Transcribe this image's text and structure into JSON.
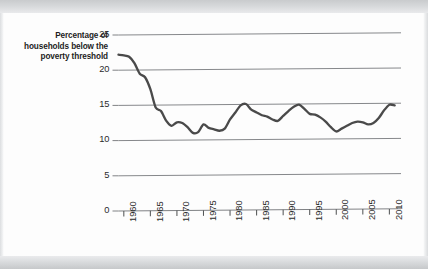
{
  "chart_data": {
    "type": "line",
    "title": "",
    "subtitle": "",
    "ylabel": "Percentage of households below the poverty threshold",
    "xlabel": "",
    "ylim": [
      0,
      25
    ],
    "xlim": [
      1959,
      2012
    ],
    "yticks": [
      0,
      5,
      10,
      15,
      20,
      25
    ],
    "xticks": [
      1960,
      1965,
      1970,
      1975,
      1980,
      1985,
      1990,
      1995,
      2000,
      2005,
      2010
    ],
    "grid": "horizontal",
    "legend": "none",
    "series": [
      {
        "name": "Percentage of households below the poverty threshold",
        "color": "#4a4a4a",
        "x": [
          1959,
          1960,
          1961,
          1962,
          1963,
          1964,
          1965,
          1966,
          1967,
          1968,
          1969,
          1970,
          1971,
          1972,
          1973,
          1974,
          1975,
          1976,
          1977,
          1978,
          1979,
          1980,
          1981,
          1982,
          1983,
          1984,
          1985,
          1986,
          1987,
          1988,
          1989,
          1990,
          1991,
          1992,
          1993,
          1994,
          1995,
          1996,
          1997,
          1998,
          1999,
          2000,
          2001,
          2002,
          2003,
          2004,
          2005,
          2006,
          2007,
          2008,
          2009,
          2010,
          2011
        ],
        "values": [
          22.2,
          22.1,
          21.9,
          21.0,
          19.5,
          19.0,
          17.3,
          14.7,
          14.2,
          12.8,
          12.1,
          12.6,
          12.5,
          11.9,
          11.1,
          11.2,
          12.3,
          11.8,
          11.6,
          11.4,
          11.7,
          13.0,
          14.0,
          15.0,
          15.2,
          14.4,
          14.0,
          13.6,
          13.4,
          13.0,
          12.8,
          13.5,
          14.2,
          14.8,
          15.1,
          14.5,
          13.8,
          13.7,
          13.3,
          12.7,
          11.9,
          11.3,
          11.7,
          12.1,
          12.5,
          12.7,
          12.6,
          12.3,
          12.5,
          13.2,
          14.3,
          15.1,
          15.0
        ]
      }
    ]
  },
  "axes": {
    "ylabel_text": "Percentage of households below the poverty threshold",
    "y_tick_labels": [
      "25",
      "20",
      "15",
      "10",
      "5",
      "0"
    ],
    "x_tick_labels": [
      "1960",
      "1965",
      "1970",
      "1975",
      "1980",
      "1985",
      "1990",
      "1995",
      "2000",
      "2005",
      "2010"
    ]
  },
  "style": {
    "line_color": "#4a4a4a",
    "grid_color": "#808285",
    "axis_color": "#555758",
    "text_color": "#1d1d1d",
    "page_background": "#fdfdfd"
  }
}
